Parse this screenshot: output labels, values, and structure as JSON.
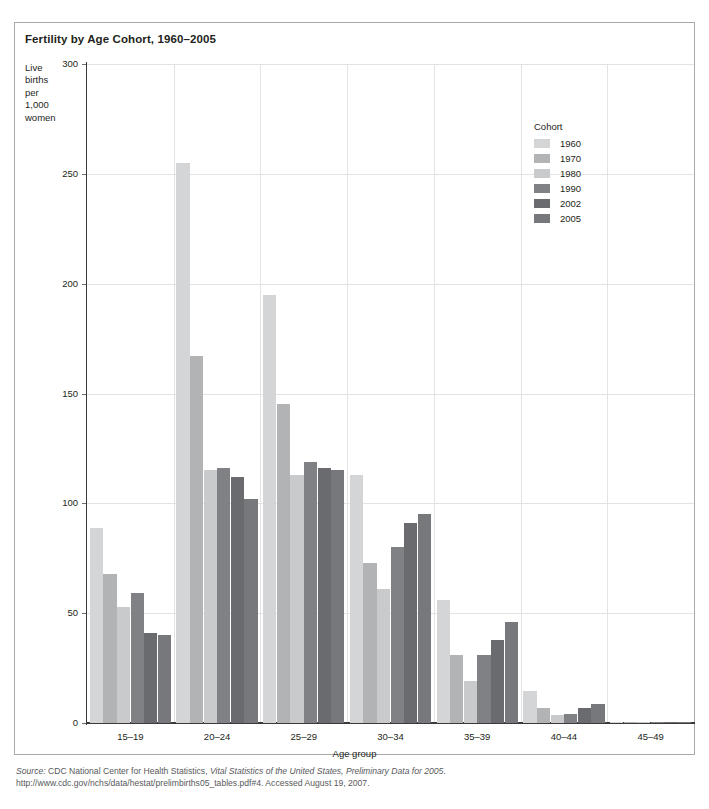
{
  "chart_title": "Fertility by Age Cohort, 1960–2005",
  "y_axis_label_lines": [
    "Live",
    "births",
    "per",
    "1,000",
    "women"
  ],
  "legend": {
    "title": "Cohort",
    "entries": [
      {
        "label": "1960",
        "color": "#d4d5d6"
      },
      {
        "label": "1970",
        "color": "#b2b3b5"
      },
      {
        "label": "1980",
        "color": "#c9cacb"
      },
      {
        "label": "1990",
        "color": "#808184"
      },
      {
        "label": "2002",
        "color": "#6a6b6e"
      },
      {
        "label": "2005",
        "color": "#77787b"
      }
    ]
  },
  "source": {
    "prefix": "Source:",
    "line1_a": " CDC National Center for Health Statistics, ",
    "line1_italic": "Vital Statistics of the United States, Preliminary Data for 2005",
    "line1_b": ".",
    "line2": "http://www.cdc.gov/nchs/data/hestat/prelimbirths05_tables.pdf#4. Accessed August 19, 2007."
  },
  "chart_data": {
    "type": "bar",
    "title": "Fertility by Age Cohort, 1960–2005",
    "xlabel": "Age group",
    "ylabel": "Live births per 1,000 women",
    "ylim": [
      0,
      300
    ],
    "yticks": [
      0,
      50,
      100,
      150,
      200,
      250,
      300
    ],
    "grid": true,
    "legend_position": "inside-top-right",
    "categories": [
      "15–19",
      "20–24",
      "25–29",
      "30–34",
      "35–39",
      "40–44",
      "45–49"
    ],
    "series": [
      {
        "name": "1960",
        "color": "#d4d5d6",
        "values": [
          89,
          255,
          195,
          113,
          56,
          14.5,
          0.2
        ]
      },
      {
        "name": "1970",
        "color": "#b2b3b5",
        "values": [
          68,
          167,
          145,
          73,
          31,
          6.8,
          0.3
        ]
      },
      {
        "name": "1980",
        "color": "#c9cacb",
        "values": [
          53,
          115,
          113,
          61,
          19,
          3.8,
          0.2
        ]
      },
      {
        "name": "1990",
        "color": "#808184",
        "values": [
          59,
          116,
          119,
          80,
          31,
          4.2,
          0.2
        ]
      },
      {
        "name": "2002",
        "color": "#6a6b6e",
        "values": [
          41,
          112,
          116,
          91,
          38,
          6.8,
          0.5
        ]
      },
      {
        "name": "2005",
        "color": "#77787b",
        "values": [
          40,
          102,
          115,
          95,
          46,
          8.5,
          0.6
        ]
      }
    ]
  }
}
